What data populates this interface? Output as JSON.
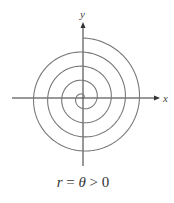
{
  "figure": {
    "caption": {
      "lhs": "r",
      "eq": " = ",
      "theta": "θ",
      "rest": " > 0"
    },
    "axes": {
      "x_label": "x",
      "y_label": "y"
    },
    "spiral": {
      "equation": "r = θ",
      "condition": "θ > 0",
      "turns": 4.25,
      "color": "#777777"
    },
    "colors": {
      "axis": "#333333",
      "curve": "#777777"
    }
  }
}
